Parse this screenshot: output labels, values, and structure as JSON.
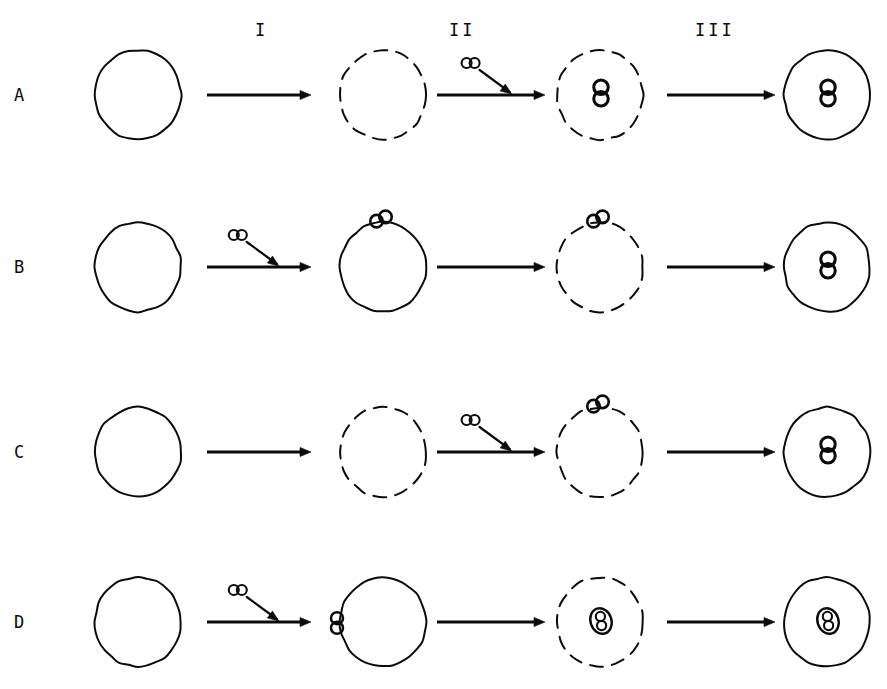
{
  "figure": {
    "type": "diagram",
    "background_color": "#ffffff",
    "ink_color": "#0b0b0b",
    "canvas": {
      "width": 887,
      "height": 689
    }
  },
  "stage_labels": [
    {
      "text": "I",
      "x": 255,
      "y": 20
    },
    {
      "text": "II",
      "x": 449,
      "y": 20
    },
    {
      "text": "III",
      "x": 695,
      "y": 20
    }
  ],
  "row_labels": [
    {
      "text": "A",
      "x": 14,
      "y": 85
    },
    {
      "text": "B",
      "x": 14,
      "y": 257
    },
    {
      "text": "C",
      "x": 14,
      "y": 442
    },
    {
      "text": "D",
      "x": 14,
      "y": 612
    }
  ],
  "geometry": {
    "column_centers_x": [
      138,
      383,
      600,
      827
    ],
    "row_centers_y": [
      95,
      267,
      452,
      622
    ],
    "cell_radius": 43,
    "arrow_segments": [
      {
        "x1": 207,
        "x2": 311
      },
      {
        "x1": 437,
        "x2": 545
      },
      {
        "x1": 667,
        "x2": 775
      }
    ],
    "pair_symbol": {
      "lobe_radius": 5.0,
      "lobe_gap": 8.0
    }
  },
  "rows": [
    {
      "id": "A",
      "label": "A",
      "cells": [
        {
          "outline": "solid",
          "content": "empty",
          "attached_pair": "none"
        },
        {
          "outline": "dashed",
          "content": "empty",
          "attached_pair": "none"
        },
        {
          "outline": "dashed",
          "content": "pair-vertical",
          "attached_pair": "none"
        },
        {
          "outline": "solid",
          "content": "pair-vertical",
          "attached_pair": "none"
        }
      ],
      "arrows": [
        {
          "stage": "I",
          "incoming_pair": false
        },
        {
          "stage": "II",
          "incoming_pair": true
        },
        {
          "stage": "III",
          "incoming_pair": false
        }
      ]
    },
    {
      "id": "B",
      "label": "B",
      "cells": [
        {
          "outline": "solid",
          "content": "empty",
          "attached_pair": "none"
        },
        {
          "outline": "solid",
          "content": "empty",
          "attached_pair": "top"
        },
        {
          "outline": "dashed",
          "content": "empty",
          "attached_pair": "top"
        },
        {
          "outline": "solid",
          "content": "pair-vertical",
          "attached_pair": "none"
        }
      ],
      "arrows": [
        {
          "stage": "I",
          "incoming_pair": true
        },
        {
          "stage": "II",
          "incoming_pair": false
        },
        {
          "stage": "III",
          "incoming_pair": false
        }
      ]
    },
    {
      "id": "C",
      "label": "C",
      "cells": [
        {
          "outline": "solid",
          "content": "empty",
          "attached_pair": "none"
        },
        {
          "outline": "dashed",
          "content": "empty",
          "attached_pair": "none"
        },
        {
          "outline": "dashed",
          "content": "empty",
          "attached_pair": "top"
        },
        {
          "outline": "solid",
          "content": "pair-vertical",
          "attached_pair": "none"
        }
      ],
      "arrows": [
        {
          "stage": "I",
          "incoming_pair": false
        },
        {
          "stage": "II",
          "incoming_pair": true
        },
        {
          "stage": "III",
          "incoming_pair": false
        }
      ]
    },
    {
      "id": "D",
      "label": "D",
      "cells": [
        {
          "outline": "solid",
          "content": "empty",
          "attached_pair": "none"
        },
        {
          "outline": "solid",
          "content": "empty",
          "attached_pair": "left"
        },
        {
          "outline": "dashed",
          "content": "pair-encapsulated",
          "attached_pair": "none"
        },
        {
          "outline": "solid",
          "content": "pair-encapsulated",
          "attached_pair": "none"
        }
      ],
      "arrows": [
        {
          "stage": "I",
          "incoming_pair": true
        },
        {
          "stage": "II",
          "incoming_pair": false
        },
        {
          "stage": "III",
          "incoming_pair": false
        }
      ]
    }
  ]
}
